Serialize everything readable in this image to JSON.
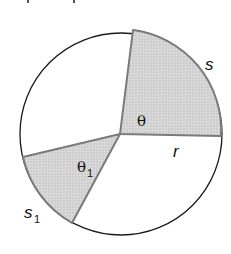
{
  "diagram": {
    "type": "circle-sectors",
    "colors": {
      "shade_fill": "#d4d4d4",
      "shade_edge": "#7a7a7a",
      "circle_stroke": "#1a1a1a",
      "background": "#ffffff"
    },
    "circle": {
      "cx": 121,
      "cy": 134,
      "r": 101
    },
    "sectors": [
      {
        "name": "sector-theta",
        "angle_label": "θ",
        "arc_label": "s",
        "shaded": true
      },
      {
        "name": "sector-theta1",
        "angle_label": "θ",
        "angle_subscript": "1",
        "arc_label": "s",
        "arc_subscript": "1",
        "shaded": true
      }
    ],
    "labels": {
      "theta": "θ",
      "theta1_main": "θ",
      "theta1_sub": "1",
      "s": "s",
      "s1_main": "s",
      "s1_sub": "1",
      "r": "r"
    }
  }
}
